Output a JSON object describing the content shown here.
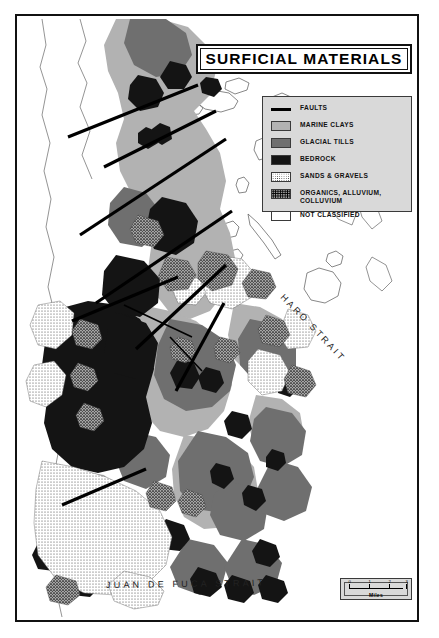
{
  "figure": {
    "title": "SURFICIAL MATERIALS",
    "kind": "geologic-map"
  },
  "legend": {
    "items": [
      {
        "label": "FAULTS",
        "swatch": "fault-line-swatch",
        "color": "#000000"
      },
      {
        "label": "MARINE CLAYS",
        "swatch": "marine-clay-swatch",
        "color": "#b2b2b2"
      },
      {
        "label": "GLACIAL TILLS",
        "swatch": "glacial-till-swatch",
        "color": "#6f6f6f"
      },
      {
        "label": "BEDROCK",
        "swatch": "bedrock-swatch",
        "color": "#141414"
      },
      {
        "label": "SANDS & GRAVELS",
        "swatch": "sand-gravel-swatch",
        "color": "#ffffff"
      },
      {
        "label": "ORGANICS, ALLUVIUM,\nCOLLUVIUM",
        "swatch": "organics-swatch",
        "color": "#9a9a9a"
      },
      {
        "label": "NOT CLASSIFIED",
        "swatch": "unclassified-swatch",
        "color": "#ffffff"
      }
    ]
  },
  "scale": {
    "units": "Miles",
    "ticks": [
      "0",
      "1",
      "2",
      "3"
    ]
  },
  "water_labels": {
    "haro_strait": "HARO STRAIT",
    "juan_de_fuca": "JUAN DE FUCA STRAIT"
  }
}
